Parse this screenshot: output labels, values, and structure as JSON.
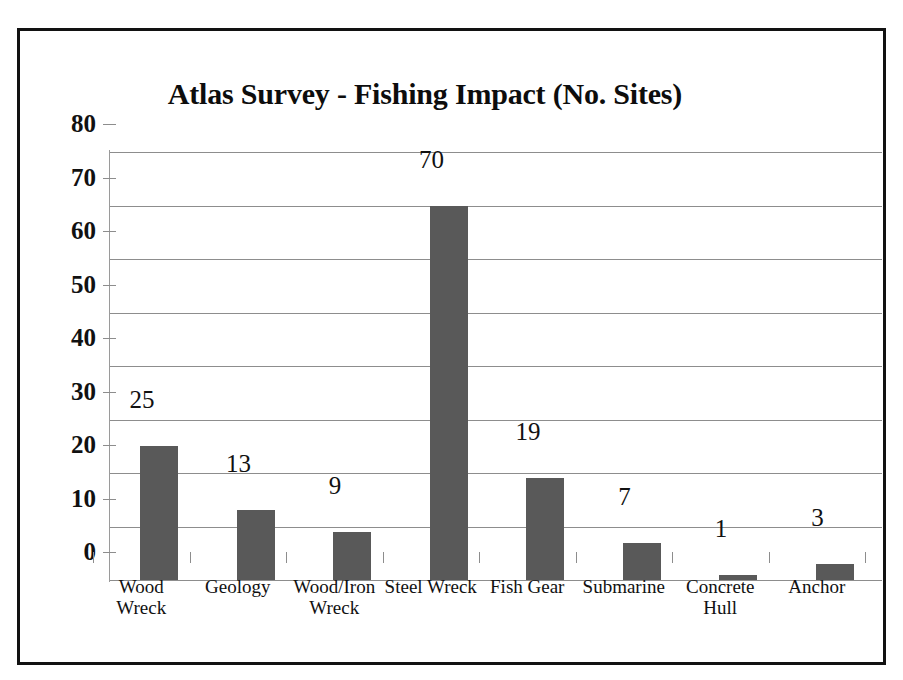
{
  "chart_data": {
    "type": "bar",
    "title": "Atlas Survey - Fishing Impact (No. Sites)",
    "xlabel": "",
    "ylabel": "",
    "categories": [
      "Wood Wreck",
      "Geology",
      "Wood/Iron Wreck",
      "Steel Wreck",
      "Fish Gear",
      "Submarine",
      "Concrete Hull",
      "Anchor"
    ],
    "category_lines": [
      "Wood\nWreck",
      "Geology",
      "Wood/Iron\nWreck",
      "Steel Wreck",
      "Fish Gear",
      "Submarine",
      "Concrete\nHull",
      "Anchor"
    ],
    "values": [
      25,
      13,
      9,
      70,
      19,
      7,
      1,
      3
    ],
    "value_labels": [
      "25",
      "13",
      "9",
      "70",
      "19",
      "7",
      "1",
      "3"
    ],
    "ylim": [
      0,
      80
    ],
    "ytick_labels": [
      "0",
      "10",
      "20",
      "30",
      "40",
      "50",
      "60",
      "70",
      "80"
    ],
    "ytick_values": [
      0,
      10,
      20,
      30,
      40,
      50,
      60,
      70,
      80
    ],
    "grid": true,
    "legend": false,
    "bar_color": "#595959",
    "grid_color": "#8d8d8d",
    "text_color": "#111111",
    "background_color": "#ffffff",
    "frame_color": "#121212"
  }
}
